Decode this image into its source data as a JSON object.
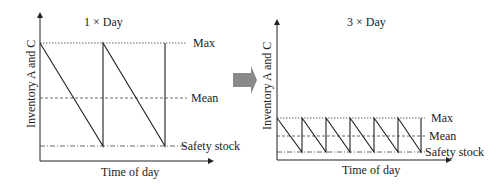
{
  "left_panel": {
    "title": "1 × Day",
    "y_label": "Inventory A and C",
    "x_label": "Time of day",
    "levels": {
      "max": "Max",
      "mean": "Mean",
      "safety": "Safety stock"
    },
    "cycles": 2
  },
  "right_panel": {
    "title": "3 × Day",
    "y_label": "Inventory A and C",
    "x_label": "Time of day",
    "levels": {
      "max": "Max",
      "mean": "Mean",
      "safety": "Safety stock"
    },
    "cycles": 6
  },
  "transition_arrow": {
    "color": "#8a8a8a"
  },
  "colors": {
    "line": "#222222",
    "arrow": "#8a8a8a"
  }
}
